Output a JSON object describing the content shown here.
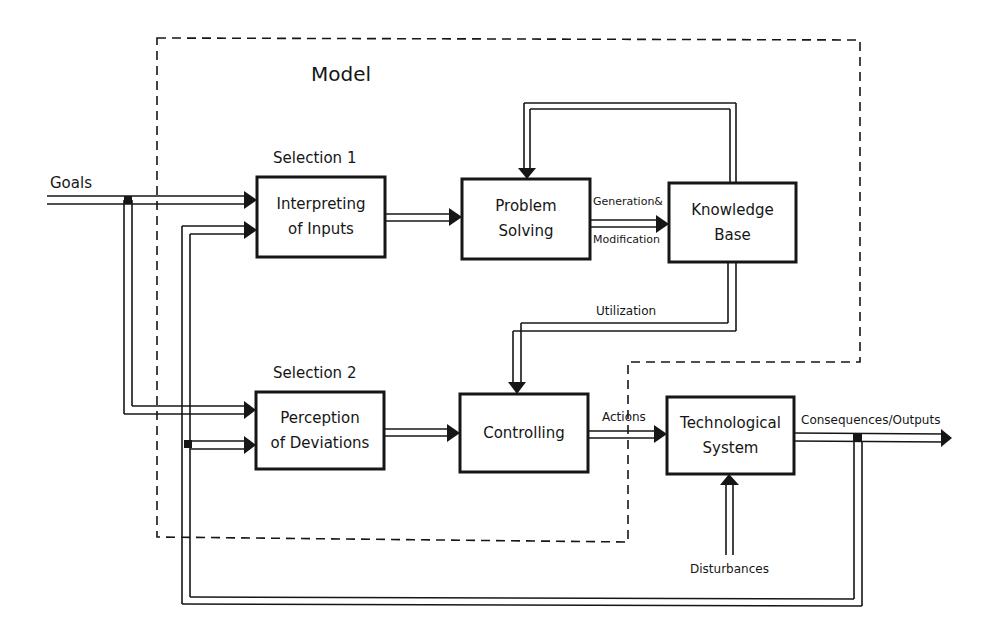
{
  "diagram": {
    "region_label": "Model",
    "selection_labels": {
      "selection_1": "Selection 1",
      "selection_2": "Selection 2"
    },
    "blocks": {
      "interpreting": {
        "line1": "Interpreting",
        "line2": "of Inputs"
      },
      "problem_solving": {
        "line1": "Problem",
        "line2": "Solving"
      },
      "knowledge_base": {
        "line1": "Knowledge",
        "line2": "Base"
      },
      "perception": {
        "line1": "Perception",
        "line2": "of Deviations"
      },
      "controlling": {
        "line1": "Controlling"
      },
      "technological": {
        "line1": "Technological",
        "line2": "System"
      }
    },
    "flow_labels": {
      "goals": "Goals",
      "generation": "Generation&",
      "modification": "Modification",
      "utilization": "Utilization",
      "actions": "Actions",
      "consequences": "Consequences/Outputs",
      "disturbances": "Disturbances"
    },
    "colors": {
      "line": "#161616",
      "background": "#ffffff"
    }
  }
}
